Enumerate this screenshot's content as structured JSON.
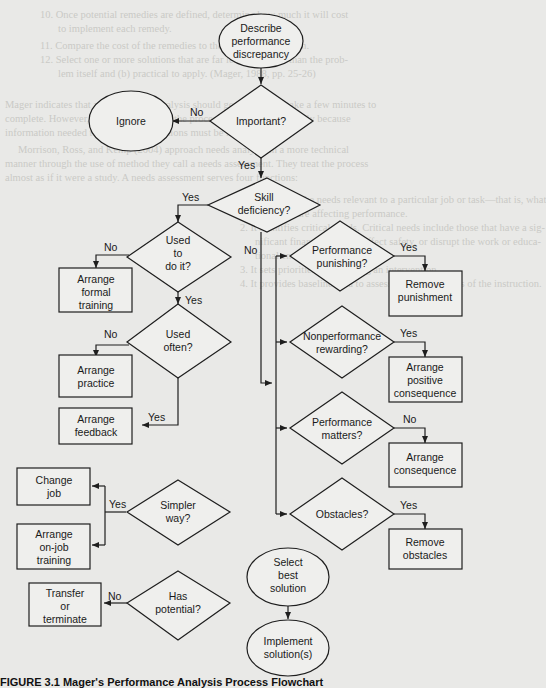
{
  "figure": {
    "caption": "FIGURE 3.1   Mager's Performance Analysis Process Flowchart"
  },
  "nodes": {
    "start": [
      "Describe",
      "performance",
      "discrepancy"
    ],
    "important": [
      "Important?"
    ],
    "ignore": [
      "Ignore"
    ],
    "skill": [
      "Skill",
      "deficiency?"
    ],
    "used_to": [
      "Used",
      "to",
      "do it?"
    ],
    "formal_training": [
      "Arrange",
      "formal",
      "training"
    ],
    "used_often": [
      "Used",
      "often?"
    ],
    "practice": [
      "Arrange",
      "practice"
    ],
    "feedback": [
      "Arrange",
      "feedback"
    ],
    "simpler": [
      "Simpler",
      "way?"
    ],
    "change_job": [
      "Change",
      "job"
    ],
    "onjob": [
      "Arrange",
      "on-job",
      "training"
    ],
    "potential": [
      "Has",
      "potential?"
    ],
    "transfer": [
      "Transfer",
      "or",
      "terminate"
    ],
    "punishing": [
      "Performance",
      "punishing?"
    ],
    "remove_punishment": [
      "Remove",
      "punishment"
    ],
    "nonperf": [
      "Nonperformance",
      "rewarding?"
    ],
    "positive": [
      "Arrange",
      "positive",
      "consequence"
    ],
    "matters": [
      "Performance",
      "matters?"
    ],
    "consequence": [
      "Arrange",
      "consequence"
    ],
    "obstacles": [
      "Obstacles?"
    ],
    "remove_obstacles": [
      "Remove",
      "obstacles"
    ],
    "select": [
      "Select",
      "best",
      "solution"
    ],
    "implement": [
      "Implement",
      "solution(s)"
    ]
  },
  "edges": {
    "important_no": "No",
    "important_yes": "Yes",
    "skill_yes": "Yes",
    "skill_no": "No",
    "used_to_no": "No",
    "used_to_yes": "Yes",
    "used_often_no": "No",
    "used_often_yes": "Yes",
    "simpler_yes": "Yes",
    "potential_no": "No",
    "punishing_yes": "Yes",
    "nonperf_yes": "Yes",
    "matters_no": "No",
    "obstacles_yes": "Yes"
  },
  "background_text": [
    "10. Once potential remedies are defined, determine how much it will cost",
    "to implement each remedy.",
    "11. Compare the cost of the remedies to the cost of the problem.",
    "12. Select one or more solutions that are far less expensive than the prob-",
    "lem itself and (b) practical to apply. (Mager, 1988, pp. 25-26)",
    "Mager indicates that a performance analysis should generally only take a few minutes to",
    "complete. However, in situations where the process is slow, it is generally because",
    "information needed to answer the questions must be located.",
    "Morrison, Ross, and Kemp (2004) approach needs analysis in a more technical",
    "manner through the use of method they call a needs assessment. They treat the process",
    "almost as if it were a study. A needs assessment serves four functions:",
    "1. It identifies the needs relevant to a particular job or task—that is, what",
    "problems are affecting performance.",
    "2. It identifies critical needs. Critical needs include those that have a sig-",
    "nificant financial impact, affect safety, or disrupt the work or educa-",
    "tional environment.",
    "3. It sets priorities for selecting an intervention.",
    "4. It provides baseline data to assess the effectiveness of the instruction."
  ]
}
